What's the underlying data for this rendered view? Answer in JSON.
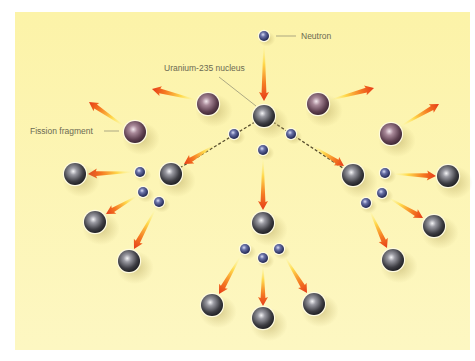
{
  "diagram": {
    "background_color": "#fdf6b4",
    "labels": {
      "neutron": "Neutron",
      "uranium_nucleus": "Uranium-235 nucleus",
      "fission_fragment": "Fission fragment"
    },
    "colors": {
      "panel": "#fdf6b4",
      "nucleus": "#4a4a50",
      "fragment": "#7a5a6a",
      "neutron": "#3a4070",
      "arrow_start": "#fff27a",
      "arrow_end": "#e8401a",
      "dashed_line": "#5a5030",
      "label_text": "#6b6a52"
    },
    "nodes": {
      "incoming_neutron": {
        "x": 264,
        "y": 36
      },
      "central_nucleus": {
        "x": 264,
        "y": 116
      },
      "fragments": [
        {
          "x": 208,
          "y": 104
        },
        {
          "x": 135,
          "y": 132
        },
        {
          "x": 318,
          "y": 104
        },
        {
          "x": 391,
          "y": 134
        }
      ],
      "first_gen_neutrons": [
        {
          "x": 234,
          "y": 134
        },
        {
          "x": 291,
          "y": 134
        },
        {
          "x": 263,
          "y": 150
        }
      ],
      "second_gen_nuclei": [
        {
          "x": 171,
          "y": 174
        },
        {
          "x": 353,
          "y": 175
        },
        {
          "x": 263,
          "y": 223
        }
      ],
      "left_cluster_neutrons": [
        {
          "x": 140,
          "y": 172
        },
        {
          "x": 143,
          "y": 192
        },
        {
          "x": 159,
          "y": 202
        }
      ],
      "right_cluster_neutrons": [
        {
          "x": 385,
          "y": 173
        },
        {
          "x": 382,
          "y": 193
        },
        {
          "x": 366,
          "y": 203
        }
      ],
      "bottom_cluster_neutrons": [
        {
          "x": 245,
          "y": 249
        },
        {
          "x": 263,
          "y": 258
        },
        {
          "x": 279,
          "y": 249
        }
      ],
      "third_gen_nuclei": [
        {
          "x": 75,
          "y": 174
        },
        {
          "x": 95,
          "y": 222
        },
        {
          "x": 129,
          "y": 261
        },
        {
          "x": 448,
          "y": 176
        },
        {
          "x": 434,
          "y": 226
        },
        {
          "x": 393,
          "y": 260
        },
        {
          "x": 212,
          "y": 305
        },
        {
          "x": 263,
          "y": 318
        },
        {
          "x": 314,
          "y": 304
        }
      ]
    }
  }
}
